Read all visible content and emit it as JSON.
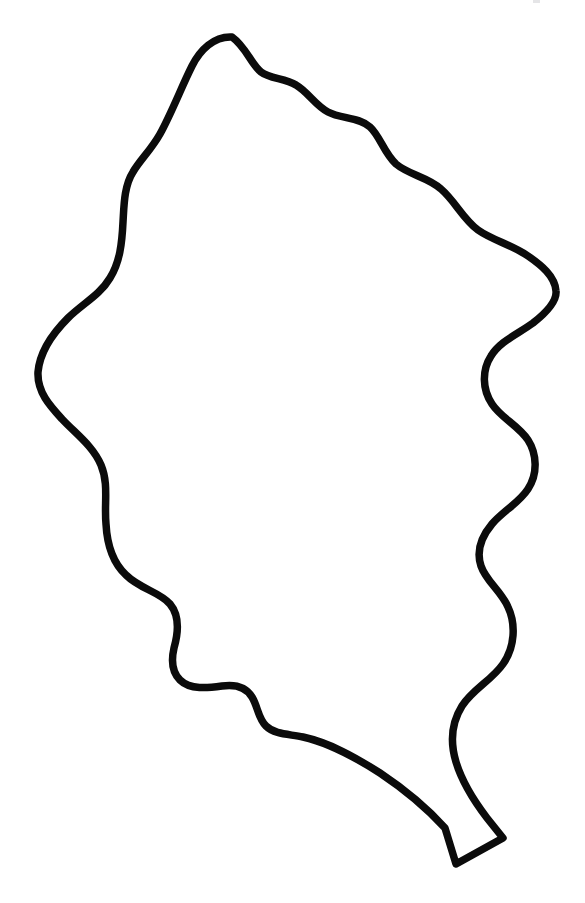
{
  "document": {
    "title": "Leaf Outline Drawing",
    "kind": "line-drawing",
    "subject": "oak-leaf-silhouette-outline",
    "canvas": {
      "width": 585,
      "height": 903,
      "background_color": "#ffffff"
    }
  },
  "figure": {
    "name": "leaf-outline",
    "stroke_color": "#0b0b0b",
    "fill_color": "#ffffff",
    "stroke_width": 7.5,
    "bounds": {
      "left": 38,
      "top": 33,
      "right": 557,
      "bottom": 866
    },
    "extreme_points": {
      "apex_top": [
        232,
        37
      ],
      "leftmost": [
        38,
        372
      ],
      "rightmost": [
        556,
        291
      ],
      "stem_tip_bottom": [
        456,
        864
      ]
    },
    "lobe_count_left": 5,
    "lobe_count_right": 6,
    "path_d": "M 232 37 C 214 36 200 50 192 66 C 181 88 172 112 160 134 C 151 150 140 160 133 172 C 124 186 124 206 123 222 C 122 243 120 262 110 278 C 100 295 82 304 68 318 C 54 332 40 350 38 372 C 37 392 50 406 62 419 C 76 434 93 446 101 465 C 109 484 104 504 106 524 C 107 543 112 562 126 575 C 140 589 160 592 170 604 C 180 616 178 634 174 648 C 171 661 172 672 180 680 C 190 690 208 688 222 686 C 236 684 246 687 252 697 C 258 707 258 718 266 726 C 275 735 290 734 303 737 C 330 743 355 757 380 773 C 404 789 426 807 445 828 L 456 864 L 503 838 L 487 818 C 474 801 462 782 456 762 C 450 742 452 722 462 706 C 473 689 492 680 503 664 C 515 647 516 624 508 607 C 501 591 486 581 481 566 C 476 551 482 536 492 524 C 503 511 519 503 528 489 C 538 474 537 454 528 440 C 518 425 501 418 492 404 C 482 389 482 370 491 356 C 500 341 518 334 533 323 C 547 312 557 301 556 291 C 555 276 541 265 528 256 C 512 245 492 240 478 230 C 463 219 455 201 441 189 C 428 177 409 175 396 164 C 384 153 380 136 370 127 C 359 117 341 119 328 112 C 315 105 308 92 296 85 C 285 78 270 79 261 72 C 251 64 246 47 232 37 Z"
  },
  "annotations": {
    "scan_artifact_present": true,
    "scan_artifact_position": [
      533,
      0
    ]
  }
}
